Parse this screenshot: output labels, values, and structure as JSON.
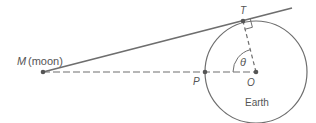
{
  "colors": {
    "line": "#6e6e6e",
    "text": "#555555",
    "background": "#ffffff"
  },
  "labels": {
    "moon_letter": "M",
    "moon_name": "(moon)",
    "tangent_point": "T",
    "point_p": "P",
    "center": "O",
    "angle": "θ",
    "earth": "Earth"
  },
  "geometry": {
    "circle": {
      "cx": 256,
      "cy": 72,
      "r": 51
    },
    "M": {
      "x": 43,
      "y": 72
    },
    "T": {
      "x": 243,
      "y": 21
    },
    "O": {
      "x": 256,
      "y": 72
    },
    "P": {
      "x": 205,
      "y": 72
    },
    "tangent_end": {
      "x": 292,
      "y": 8
    }
  }
}
